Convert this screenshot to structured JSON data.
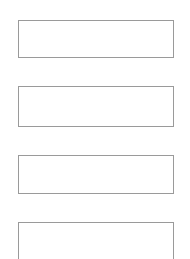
{
  "page": {
    "title": "",
    "background_color": "#ffffff",
    "width": 190,
    "height": 259
  },
  "form": {
    "border_color": "#9a9a9a",
    "fill_color": "#ffffff",
    "border_width_px": 1,
    "boxes": [
      {
        "name": "field-box-1",
        "value": "",
        "placeholder": "",
        "x": 18,
        "y": 20,
        "width": 156,
        "height": 38,
        "clipped_bottom": false
      },
      {
        "name": "field-box-2",
        "value": "",
        "placeholder": "",
        "x": 18,
        "y": 86,
        "width": 156,
        "height": 41,
        "clipped_bottom": false
      },
      {
        "name": "field-box-3",
        "value": "",
        "placeholder": "",
        "x": 18,
        "y": 155,
        "width": 156,
        "height": 39,
        "clipped_bottom": false
      },
      {
        "name": "field-box-4",
        "value": "",
        "placeholder": "",
        "x": 18,
        "y": 222,
        "width": 156,
        "height": 38,
        "clipped_bottom": true
      }
    ]
  }
}
